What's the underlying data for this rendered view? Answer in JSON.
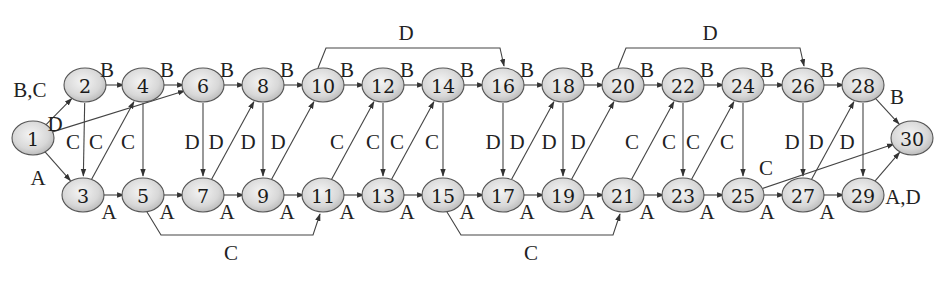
{
  "diagram": {
    "type": "activity-network",
    "nodes": [
      {
        "id": "1",
        "x": 33,
        "y": 138
      },
      {
        "id": "2",
        "x": 85,
        "y": 85
      },
      {
        "id": "3",
        "x": 83,
        "y": 195
      },
      {
        "id": "4",
        "x": 143,
        "y": 85
      },
      {
        "id": "5",
        "x": 143,
        "y": 195
      },
      {
        "id": "6",
        "x": 203,
        "y": 85
      },
      {
        "id": "7",
        "x": 203,
        "y": 195
      },
      {
        "id": "8",
        "x": 263,
        "y": 85
      },
      {
        "id": "9",
        "x": 263,
        "y": 195
      },
      {
        "id": "10",
        "x": 323,
        "y": 85
      },
      {
        "id": "11",
        "x": 323,
        "y": 195
      },
      {
        "id": "12",
        "x": 383,
        "y": 85
      },
      {
        "id": "13",
        "x": 383,
        "y": 195
      },
      {
        "id": "14",
        "x": 443,
        "y": 85
      },
      {
        "id": "15",
        "x": 443,
        "y": 195
      },
      {
        "id": "16",
        "x": 503,
        "y": 85
      },
      {
        "id": "17",
        "x": 503,
        "y": 195
      },
      {
        "id": "18",
        "x": 563,
        "y": 85
      },
      {
        "id": "19",
        "x": 563,
        "y": 195
      },
      {
        "id": "20",
        "x": 623,
        "y": 85
      },
      {
        "id": "21",
        "x": 623,
        "y": 195
      },
      {
        "id": "22",
        "x": 683,
        "y": 85
      },
      {
        "id": "23",
        "x": 683,
        "y": 195
      },
      {
        "id": "24",
        "x": 743,
        "y": 85
      },
      {
        "id": "25",
        "x": 743,
        "y": 195
      },
      {
        "id": "26",
        "x": 803,
        "y": 85
      },
      {
        "id": "27",
        "x": 803,
        "y": 195
      },
      {
        "id": "28",
        "x": 863,
        "y": 85
      },
      {
        "id": "29",
        "x": 863,
        "y": 195
      },
      {
        "id": "30",
        "x": 912,
        "y": 138
      }
    ],
    "edges": [
      {
        "from": "1",
        "to": "2",
        "label": "B,C",
        "lx": 30,
        "ly": 90
      },
      {
        "from": "1",
        "to": "6",
        "label": "D",
        "lx": 55,
        "ly": 124
      },
      {
        "from": "1",
        "to": "3",
        "label": "A",
        "lx": 38,
        "ly": 178
      },
      {
        "from": "2",
        "to": "4",
        "label": "B",
        "lx": 107,
        "ly": 70
      },
      {
        "from": "4",
        "to": "6",
        "label": "B",
        "lx": 167,
        "ly": 70
      },
      {
        "from": "6",
        "to": "8",
        "label": "B",
        "lx": 227,
        "ly": 70
      },
      {
        "from": "8",
        "to": "10",
        "label": "B",
        "lx": 287,
        "ly": 70
      },
      {
        "from": "10",
        "to": "12",
        "label": "B",
        "lx": 347,
        "ly": 70
      },
      {
        "from": "12",
        "to": "14",
        "label": "B",
        "lx": 407,
        "ly": 70
      },
      {
        "from": "14",
        "to": "16",
        "label": "B",
        "lx": 467,
        "ly": 70
      },
      {
        "from": "16",
        "to": "18",
        "label": "B",
        "lx": 527,
        "ly": 70
      },
      {
        "from": "18",
        "to": "20",
        "label": "B",
        "lx": 587,
        "ly": 70
      },
      {
        "from": "20",
        "to": "22",
        "label": "B",
        "lx": 647,
        "ly": 70
      },
      {
        "from": "22",
        "to": "24",
        "label": "B",
        "lx": 707,
        "ly": 70
      },
      {
        "from": "24",
        "to": "26",
        "label": "B",
        "lx": 767,
        "ly": 70
      },
      {
        "from": "26",
        "to": "28",
        "label": "B",
        "lx": 827,
        "ly": 70
      },
      {
        "from": "28",
        "to": "30",
        "label": "B",
        "lx": 897,
        "ly": 97
      },
      {
        "from": "2",
        "to": "3",
        "label": "C",
        "lx": 73,
        "ly": 142
      },
      {
        "from": "3",
        "to": "4",
        "label": "C",
        "lx": 96,
        "ly": 142
      },
      {
        "from": "4",
        "to": "5",
        "label": "C",
        "lx": 128,
        "ly": 142
      },
      {
        "from": "6",
        "to": "7",
        "label": "D",
        "lx": 192,
        "ly": 142
      },
      {
        "from": "7",
        "to": "8",
        "label": "D",
        "lx": 216,
        "ly": 142
      },
      {
        "from": "8",
        "to": "9",
        "label": "D",
        "lx": 248,
        "ly": 142
      },
      {
        "from": "9",
        "to": "10",
        "label": "D",
        "lx": 278,
        "ly": 142
      },
      {
        "from": "11",
        "to": "12",
        "label": "C",
        "lx": 337,
        "ly": 142
      },
      {
        "from": "12",
        "to": "13",
        "label": "C",
        "lx": 373,
        "ly": 142
      },
      {
        "from": "13",
        "to": "14",
        "label": "C",
        "lx": 397,
        "ly": 142
      },
      {
        "from": "14",
        "to": "15",
        "label": "C",
        "lx": 432,
        "ly": 142
      },
      {
        "from": "16",
        "to": "17",
        "label": "D",
        "lx": 493,
        "ly": 142
      },
      {
        "from": "17",
        "to": "18",
        "label": "D",
        "lx": 517,
        "ly": 142
      },
      {
        "from": "18",
        "to": "19",
        "label": "D",
        "lx": 549,
        "ly": 142
      },
      {
        "from": "19",
        "to": "20",
        "label": "D",
        "lx": 578,
        "ly": 142
      },
      {
        "from": "21",
        "to": "22",
        "label": "C",
        "lx": 632,
        "ly": 142
      },
      {
        "from": "22",
        "to": "23",
        "label": "C",
        "lx": 669,
        "ly": 142
      },
      {
        "from": "23",
        "to": "24",
        "label": "C",
        "lx": 693,
        "ly": 142
      },
      {
        "from": "24",
        "to": "25",
        "label": "C",
        "lx": 727,
        "ly": 142
      },
      {
        "from": "26",
        "to": "27",
        "label": "D",
        "lx": 792,
        "ly": 142
      },
      {
        "from": "27",
        "to": "28",
        "label": "D",
        "lx": 816,
        "ly": 142
      },
      {
        "from": "28",
        "to": "29",
        "label": "D",
        "lx": 847,
        "ly": 142
      },
      {
        "from": "25",
        "to": "30",
        "label": "C",
        "lx": 766,
        "ly": 168
      },
      {
        "from": "3",
        "to": "5",
        "label": "A",
        "lx": 109,
        "ly": 212
      },
      {
        "from": "5",
        "to": "7",
        "label": "A",
        "lx": 167,
        "ly": 212
      },
      {
        "from": "7",
        "to": "9",
        "label": "A",
        "lx": 227,
        "ly": 212
      },
      {
        "from": "9",
        "to": "11",
        "label": "A",
        "lx": 287,
        "ly": 212
      },
      {
        "from": "11",
        "to": "13",
        "label": "A",
        "lx": 347,
        "ly": 212
      },
      {
        "from": "13",
        "to": "15",
        "label": "A",
        "lx": 407,
        "ly": 212
      },
      {
        "from": "15",
        "to": "17",
        "label": "A",
        "lx": 467,
        "ly": 212
      },
      {
        "from": "17",
        "to": "19",
        "label": "A",
        "lx": 527,
        "ly": 212
      },
      {
        "from": "19",
        "to": "21",
        "label": "A",
        "lx": 587,
        "ly": 212
      },
      {
        "from": "21",
        "to": "23",
        "label": "A",
        "lx": 647,
        "ly": 212
      },
      {
        "from": "23",
        "to": "25",
        "label": "A",
        "lx": 707,
        "ly": 212
      },
      {
        "from": "25",
        "to": "27",
        "label": "A",
        "lx": 767,
        "ly": 212
      },
      {
        "from": "27",
        "to": "29",
        "label": "A",
        "lx": 827,
        "ly": 212
      },
      {
        "from": "29",
        "to": "30",
        "label": "A,D",
        "lx": 903,
        "ly": 197
      }
    ],
    "brackets": [
      {
        "from": "10",
        "to": "16",
        "label": "D",
        "position": "top",
        "lx": 406,
        "ly": 33
      },
      {
        "from": "20",
        "to": "26",
        "label": "D",
        "position": "top",
        "lx": 710,
        "ly": 33
      },
      {
        "from": "5",
        "to": "11",
        "label": "C",
        "position": "bottom",
        "lx": 231,
        "ly": 253
      },
      {
        "from": "15",
        "to": "21",
        "label": "C",
        "position": "bottom",
        "lx": 531,
        "ly": 253
      }
    ]
  }
}
